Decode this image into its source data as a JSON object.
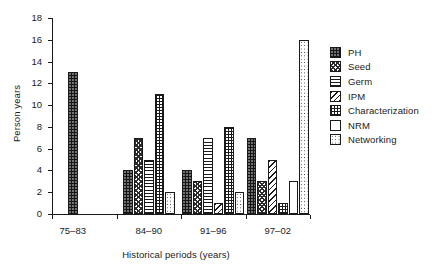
{
  "chart_data": {
    "type": "bar",
    "title": "",
    "xlabel": "Historical periods (years)",
    "ylabel": "Person years",
    "categories": [
      "75–83",
      "84–90",
      "91–96",
      "97–02"
    ],
    "series": [
      {
        "name": "PH",
        "values": [
          13,
          4,
          4,
          7
        ]
      },
      {
        "name": "Seed",
        "values": [
          0,
          7,
          3,
          3
        ]
      },
      {
        "name": "Germ",
        "values": [
          0,
          5,
          7,
          0
        ]
      },
      {
        "name": "IPM",
        "values": [
          0,
          0,
          1,
          5
        ]
      },
      {
        "name": "Characterization",
        "values": [
          0,
          11,
          8,
          1
        ]
      },
      {
        "name": "NRM",
        "values": [
          0,
          0,
          0,
          3
        ]
      },
      {
        "name": "Networking",
        "values": [
          0,
          2,
          2,
          16
        ]
      }
    ],
    "ylim": [
      0,
      18
    ],
    "yticks": [
      0,
      2,
      4,
      6,
      8,
      10,
      12,
      14,
      16,
      18
    ],
    "grid": false,
    "legend_position": "right"
  },
  "legend": {
    "items": [
      {
        "label": "PH",
        "pattern": "solid-dark-speckle"
      },
      {
        "label": "Seed",
        "pattern": "dark-checker"
      },
      {
        "label": "Germ",
        "pattern": "horizontal-lines"
      },
      {
        "label": "IPM",
        "pattern": "diagonal-hatch"
      },
      {
        "label": "Characterization",
        "pattern": "grid-crosshatch"
      },
      {
        "label": "NRM",
        "pattern": "empty-white"
      },
      {
        "label": "Networking",
        "pattern": "sparse-dots"
      }
    ]
  }
}
